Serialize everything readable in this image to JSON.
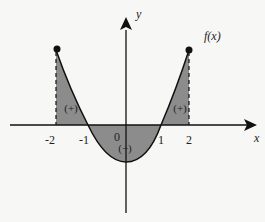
{
  "diagram": {
    "function_label": "f(x)",
    "axes": {
      "x_label": "x",
      "y_label": "y",
      "x_ticks": [
        "-2",
        "-1",
        "0",
        "1",
        "2"
      ]
    },
    "regions": [
      {
        "interval": "[-2, -1]",
        "sign": "(+)"
      },
      {
        "interval": "[-1, 1]",
        "sign": "(−)"
      },
      {
        "interval": "[1, 2]",
        "sign": "(+)"
      }
    ],
    "endpoints": [
      {
        "x": -2,
        "marker": "filled-dot"
      },
      {
        "x": 2,
        "marker": "filled-dot"
      }
    ],
    "colors": {
      "shade": "#8c8c8c",
      "curve": "#111111",
      "background": "#f7f7f5"
    }
  }
}
